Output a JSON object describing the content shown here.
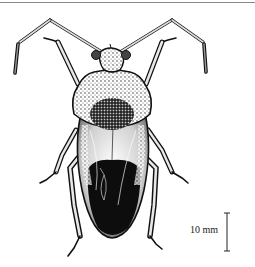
{
  "figure": {
    "style": "black ink stipple drawing",
    "colors": {
      "ink": "#111111",
      "shade": "#555555",
      "paper": "#ffffff",
      "rule": "#8a8a8a"
    }
  },
  "scale": {
    "label": "10 mm"
  }
}
